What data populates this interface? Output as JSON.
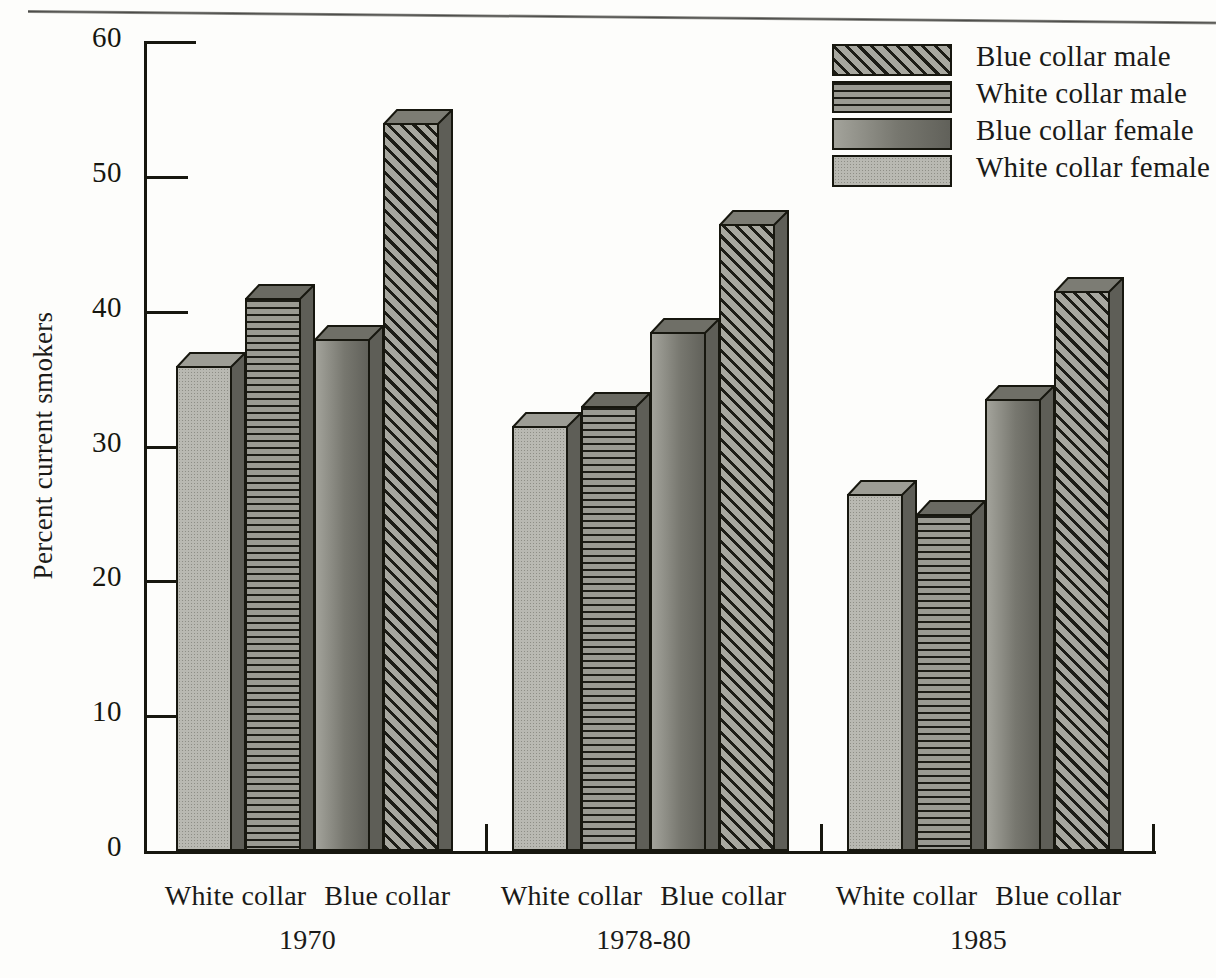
{
  "chart_data": {
    "type": "bar",
    "title": "",
    "xlabel": "",
    "ylabel": "Percent current smokers",
    "ylim": [
      0,
      60
    ],
    "yticks": [
      0,
      10,
      20,
      30,
      40,
      50,
      60
    ],
    "grid": false,
    "legend_position": "top-right",
    "categories": [
      "1970",
      "1978-80",
      "1985"
    ],
    "group_sublabels": [
      "White collar",
      "Blue collar"
    ],
    "series": [
      {
        "name": "Blue collar male",
        "key": "bcm",
        "values": [
          54.0,
          46.5,
          41.5
        ]
      },
      {
        "name": "White collar male",
        "key": "wcm",
        "values": [
          41.0,
          33.0,
          25.0
        ]
      },
      {
        "name": "Blue collar female",
        "key": "bcf",
        "values": [
          38.0,
          38.5,
          33.5
        ]
      },
      {
        "name": "White collar female",
        "key": "wcf",
        "values": [
          36.0,
          31.5,
          26.5
        ]
      }
    ],
    "bar_order_within_group": [
      "White collar female",
      "White collar male",
      "Blue collar female",
      "Blue collar male"
    ]
  },
  "axis": {
    "y_title": "Percent current smokers",
    "y_ticks": [
      "60",
      "50",
      "40",
      "30",
      "20",
      "10",
      "0"
    ]
  },
  "legend": {
    "items": [
      {
        "label": "Blue collar male",
        "pattern": "diagonal-hatch"
      },
      {
        "label": "White collar male",
        "pattern": "horizontal-lines"
      },
      {
        "label": "Blue collar female",
        "pattern": "dark-solid-gradient"
      },
      {
        "label": "White collar female",
        "pattern": "light-stipple"
      }
    ]
  },
  "x_groups": [
    {
      "left_label": "White collar",
      "right_label": "Blue collar",
      "year": "1970"
    },
    {
      "left_label": "White collar",
      "right_label": "Blue collar",
      "year": "1978-80"
    },
    {
      "left_label": "White collar",
      "right_label": "Blue collar",
      "year": "1985"
    }
  ],
  "colors": {
    "ink": "#17170f",
    "paper": "#fdfdfb",
    "white_collar_female": "#b9b9b2",
    "white_collar_male": "#9a9a92",
    "blue_collar_female": "#8c8c84",
    "blue_collar_male": "#a7a79f"
  }
}
